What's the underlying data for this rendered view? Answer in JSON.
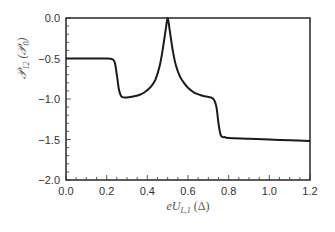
{
  "chart_data": {
    "type": "line",
    "title": "",
    "xlabel": "eU_{L,1} (Δ)",
    "xlabel_display": "eU",
    "xlabel_sub": "L,1",
    "xlabel_unit": " (Δ)",
    "ylabel": "P_12 (P_0)",
    "ylabel_display": "𝒫",
    "ylabel_sub": "12",
    "ylabel_unit": " (𝒫",
    "ylabel_unit_sub": "0",
    "ylabel_close": ")",
    "xlim": [
      0.0,
      1.2
    ],
    "ylim": [
      -2.0,
      0.0
    ],
    "xticks": [
      "0.0",
      "0.2",
      "0.4",
      "0.6",
      "0.8",
      "1.0",
      "1.2"
    ],
    "xtick_values": [
      0.0,
      0.2,
      0.4,
      0.6,
      0.8,
      1.0,
      1.2
    ],
    "yticks": [
      "0.0",
      "-0.5",
      "-1.0",
      "-1.5",
      "-2.0"
    ],
    "ytick_values": [
      0.0,
      -0.5,
      -1.0,
      -1.5,
      -2.0
    ],
    "grid": false,
    "legend": "none",
    "series": [
      {
        "name": "P12",
        "color": "#1a1a1a",
        "x": [
          0.0,
          0.1,
          0.2,
          0.23,
          0.24,
          0.25,
          0.26,
          0.27,
          0.28,
          0.3,
          0.33,
          0.36,
          0.39,
          0.42,
          0.44,
          0.46,
          0.475,
          0.49,
          0.5,
          0.51,
          0.525,
          0.54,
          0.56,
          0.58,
          0.6,
          0.63,
          0.66,
          0.69,
          0.71,
          0.72,
          0.73,
          0.74,
          0.75,
          0.76,
          0.77,
          0.78,
          0.8,
          0.9,
          1.0,
          1.1,
          1.2
        ],
        "y": [
          -0.5,
          -0.5,
          -0.5,
          -0.51,
          -0.55,
          -0.7,
          -0.88,
          -0.96,
          -0.98,
          -0.98,
          -0.97,
          -0.95,
          -0.91,
          -0.84,
          -0.76,
          -0.6,
          -0.4,
          -0.15,
          0.0,
          -0.15,
          -0.4,
          -0.58,
          -0.72,
          -0.8,
          -0.86,
          -0.92,
          -0.95,
          -0.97,
          -0.98,
          -0.99,
          -1.02,
          -1.1,
          -1.3,
          -1.44,
          -1.47,
          -1.47,
          -1.48,
          -1.49,
          -1.5,
          -1.51,
          -1.52
        ]
      }
    ]
  }
}
